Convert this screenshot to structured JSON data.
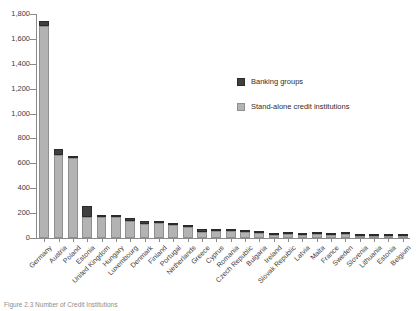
{
  "chart_data": {
    "type": "bar",
    "title": "",
    "subtitle": "",
    "xlabel": "",
    "ylabel": "",
    "ylim": [
      0,
      1800
    ],
    "ytick_values": [
      0,
      200,
      400,
      600,
      800,
      1000,
      1200,
      1400,
      1600,
      1800
    ],
    "ytick_labels": [
      "0",
      "200",
      "400",
      "600",
      "800",
      "1,000",
      "1,200",
      "1,400",
      "1,600",
      "1,800"
    ],
    "grid": false,
    "stacked": true,
    "legend_position": "upper-right-inside",
    "categories": [
      "Germany",
      "Austria",
      "Poland",
      "Estonia",
      "United Kingdom",
      "Hungary",
      "Luxembourg",
      "Denmark",
      "Finland",
      "Portugal",
      "Netherlands",
      "Greece",
      "Cyprus",
      "Romania",
      "Czech Republic",
      "Bulgaria",
      "Ireland",
      "Slovak Republic",
      "Latvia",
      "Malta",
      "France",
      "Sweden",
      "Slovenia",
      "Lithuania",
      "Estonia",
      "Belgium"
    ],
    "series": [
      {
        "name": "Stand-alone credit institutions",
        "color": "#b3b3b3",
        "values": [
          1700,
          670,
          655,
          165,
          175,
          170,
          140,
          115,
          125,
          105,
          100,
          50,
          60,
          62,
          55,
          38,
          30,
          32,
          30,
          45,
          25,
          40,
          30,
          22,
          20,
          22
        ]
      },
      {
        "name": "Banking groups",
        "color": "#3f3f3f",
        "values": [
          42,
          45,
          8,
          90,
          10,
          12,
          22,
          18,
          15,
          14,
          6,
          22,
          16,
          12,
          12,
          18,
          14,
          14,
          14,
          5,
          18,
          10,
          6,
          10,
          10,
          10
        ]
      }
    ],
    "totals": [
      1742,
      715,
      663,
      255,
      185,
      182,
      162,
      133,
      140,
      119,
      106,
      72,
      76,
      74,
      67,
      56,
      44,
      46,
      44,
      50,
      43,
      50,
      36,
      32,
      30,
      32
    ]
  },
  "legend": {
    "items": [
      {
        "label": "Banking groups",
        "swatch": "dark"
      },
      {
        "label": "Stand-alone credit institutions",
        "swatch": "light"
      }
    ]
  },
  "caption": {
    "text": "Figure 2.3   Number of Credit Institutions"
  },
  "colors": {
    "banking_groups": "#3f3f3f",
    "stand_alone": "#b3b3b3",
    "axis": "#8a8a8a",
    "text": "#3d3d3d"
  }
}
